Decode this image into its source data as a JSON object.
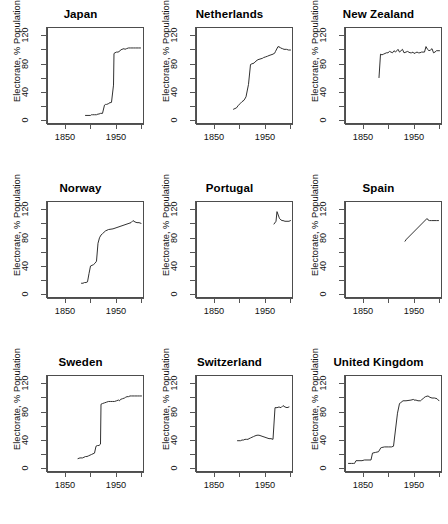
{
  "chart_data": {
    "type": "line",
    "title": "",
    "layout": {
      "rows": 3,
      "cols": 3,
      "grid": false,
      "legend": "none"
    },
    "xlabel": "",
    "ylabel": "Electorate, % Population",
    "xlim": [
      1815,
      2005
    ],
    "ylim": [
      -6,
      132
    ],
    "xticks": [
      1850,
      1900,
      1950,
      2000
    ],
    "xtick_labels": [
      "1850",
      "",
      "1950",
      ""
    ],
    "yticks": [
      0,
      20,
      40,
      60,
      80,
      100,
      120
    ],
    "ytick_labels": [
      "0",
      "",
      "40",
      "",
      "80",
      "",
      "120"
    ],
    "panels": [
      {
        "title": "Japan",
        "x": [
          1890,
          1895,
          1900,
          1902,
          1904,
          1908,
          1912,
          1915,
          1917,
          1920,
          1924,
          1928,
          1930,
          1932,
          1936,
          1937,
          1942,
          1946,
          1947,
          1949,
          1952,
          1955,
          1958,
          1960,
          1963,
          1967,
          1969,
          1972,
          1976,
          1979,
          1980,
          1983,
          1986,
          1990,
          1993,
          1996,
          2000
        ],
        "y": [
          5,
          5,
          5,
          6,
          6,
          6,
          6,
          7,
          7,
          8,
          8,
          20,
          21,
          21,
          22,
          23,
          24,
          49,
          95,
          96,
          97,
          97,
          98,
          100,
          101,
          102,
          101,
          102,
          103,
          103,
          103,
          103,
          103,
          103,
          103,
          103,
          103
        ],
        "ylabel": "Electorate, % Population"
      },
      {
        "title": "Netherlands",
        "x": [
          1888,
          1891,
          1894,
          1897,
          1901,
          1905,
          1909,
          1913,
          1918,
          1922,
          1925,
          1929,
          1933,
          1937,
          1946,
          1948,
          1952,
          1956,
          1959,
          1963,
          1967,
          1971,
          1972,
          1977,
          1981,
          1982,
          1986,
          1989,
          1994,
          1998,
          2002
        ],
        "y": [
          14,
          15,
          16,
          19,
          22,
          25,
          27,
          32,
          50,
          79,
          80,
          81,
          84,
          86,
          88,
          89,
          90,
          91,
          92,
          93,
          94,
          96,
          98,
          105,
          104,
          103,
          102,
          101,
          101,
          100,
          100
        ],
        "ylabel": "Electorate, % Population"
      },
      {
        "title": "New Zealand",
        "x": [
          1881,
          1884,
          1887,
          1890,
          1893,
          1896,
          1899,
          1902,
          1905,
          1908,
          1911,
          1914,
          1919,
          1922,
          1925,
          1928,
          1931,
          1935,
          1938,
          1943,
          1946,
          1949,
          1951,
          1954,
          1957,
          1960,
          1963,
          1966,
          1969,
          1972,
          1975,
          1978,
          1981,
          1984,
          1987,
          1990,
          1993,
          1996,
          1999,
          2002
        ],
        "y": [
          60,
          94,
          93,
          94,
          95,
          96,
          96,
          98,
          97,
          96,
          99,
          97,
          101,
          97,
          99,
          101,
          96,
          97,
          98,
          96,
          96,
          97,
          95,
          96,
          97,
          96,
          96,
          97,
          97,
          97,
          105,
          101,
          99,
          100,
          102,
          96,
          97,
          99,
          99,
          99
        ],
        "ylabel": "Electorate, % Population"
      },
      {
        "title": "Norway",
        "x": [
          1882,
          1885,
          1888,
          1891,
          1894,
          1897,
          1900,
          1903,
          1906,
          1909,
          1912,
          1915,
          1918,
          1921,
          1924,
          1927,
          1930,
          1933,
          1936,
          1945,
          1949,
          1953,
          1957,
          1961,
          1965,
          1969,
          1973,
          1977,
          1981,
          1985,
          1989,
          1993,
          1997,
          2001
        ],
        "y": [
          14,
          14,
          15,
          15,
          16,
          28,
          39,
          40,
          41,
          43,
          46,
          72,
          80,
          84,
          86,
          88,
          90,
          91,
          92,
          93,
          94,
          95,
          96,
          97,
          98,
          99,
          100,
          101,
          102,
          105,
          103,
          102,
          102,
          101
        ],
        "ylabel": "Electorate, % Population"
      },
      {
        "title": "Portugal",
        "x": [
          1969,
          1973,
          1975,
          1976,
          1979,
          1980,
          1983,
          1985,
          1987,
          1991,
          1995,
          1999,
          2002
        ],
        "y": [
          100,
          104,
          118,
          116,
          110,
          108,
          106,
          105,
          105,
          104,
          104,
          104,
          105
        ],
        "ylabel": "Electorate, % Population"
      },
      {
        "title": "Spain",
        "x": [
          1933,
          1936,
          1977,
          1979,
          1982,
          1986,
          1989,
          1993,
          1996,
          2000
        ],
        "y": [
          75,
          78,
          108,
          106,
          105,
          105,
          105,
          105,
          105,
          105
        ],
        "ylabel": "Electorate, % Population"
      },
      {
        "title": "Sweden",
        "x": [
          1875,
          1879,
          1884,
          1887,
          1890,
          1893,
          1896,
          1899,
          1902,
          1905,
          1908,
          1911,
          1914,
          1917,
          1920,
          1921,
          1924,
          1928,
          1932,
          1936,
          1940,
          1944,
          1948,
          1952,
          1956,
          1958,
          1960,
          1964,
          1968,
          1970,
          1973,
          1976,
          1979,
          1982,
          1985,
          1988,
          1991,
          1994,
          1998,
          2002
        ],
        "y": [
          12,
          13,
          13,
          14,
          15,
          15,
          16,
          17,
          18,
          19,
          20,
          30,
          31,
          31,
          33,
          91,
          92,
          93,
          94,
          95,
          95,
          95,
          95,
          96,
          97,
          96,
          98,
          99,
          100,
          101,
          102,
          102,
          103,
          103,
          103,
          103,
          103,
          103,
          103,
          103
        ],
        "ylabel": "Electorate, % Population"
      },
      {
        "title": "Switzerland",
        "x": [
          1896,
          1899,
          1902,
          1905,
          1908,
          1911,
          1914,
          1917,
          1919,
          1922,
          1925,
          1928,
          1931,
          1935,
          1939,
          1943,
          1947,
          1951,
          1955,
          1959,
          1963,
          1967,
          1971,
          1975,
          1979,
          1983,
          1987,
          1991,
          1995,
          1999
        ],
        "y": [
          38,
          38,
          38,
          39,
          39,
          40,
          40,
          40,
          41,
          42,
          43,
          44,
          45,
          46,
          46,
          45,
          44,
          43,
          42,
          41,
          41,
          40,
          86,
          86,
          87,
          86,
          89,
          87,
          86,
          87
        ],
        "ylabel": "Electorate, % Population"
      },
      {
        "title": "United Kingdom",
        "x": [
          1820,
          1826,
          1830,
          1831,
          1832,
          1835,
          1837,
          1841,
          1847,
          1852,
          1857,
          1859,
          1865,
          1868,
          1874,
          1880,
          1885,
          1886,
          1892,
          1895,
          1900,
          1906,
          1910,
          1918,
          1922,
          1923,
          1924,
          1929,
          1931,
          1935,
          1945,
          1950,
          1951,
          1955,
          1959,
          1964,
          1966,
          1970,
          1974,
          1979,
          1983,
          1987,
          1992,
          1997,
          2001
        ],
        "y": [
          5,
          5,
          5,
          5,
          5,
          9,
          9,
          9,
          9,
          10,
          10,
          10,
          10,
          20,
          21,
          22,
          28,
          28,
          29,
          29,
          29,
          29,
          30,
          78,
          92,
          93,
          93,
          96,
          96,
          96,
          97,
          98,
          97,
          97,
          96,
          96,
          97,
          100,
          102,
          103,
          101,
          100,
          100,
          99,
          96
        ],
        "ylabel": "Electorate, % Population"
      }
    ]
  }
}
